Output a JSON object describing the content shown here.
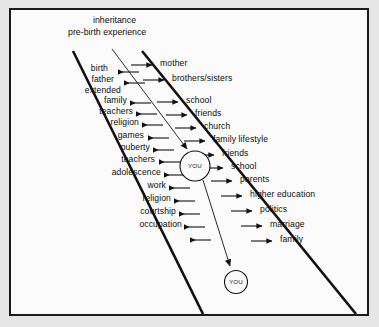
{
  "diagram": {
    "title_lines": [
      {
        "text": "inheritance",
        "x": 82,
        "y": 6
      },
      {
        "text": "pre-birth experience",
        "x": 58,
        "y": 18
      }
    ],
    "center_nodes": [
      {
        "label": "YOU",
        "cx": 184,
        "cy": 156,
        "r": 15
      },
      {
        "label": "YOU",
        "cx": 225,
        "cy": 272,
        "r": 11.5
      }
    ],
    "left_branch": {
      "name": "left-influences",
      "arrow_direction": "left",
      "labels": [
        "birth",
        "father",
        "extended",
        "family",
        "teachers",
        "religion",
        "games",
        "puberty",
        "teachers",
        "adolescence",
        "work",
        "religion",
        "courtship",
        "occupation"
      ]
    },
    "right_branch": {
      "name": "right-influences",
      "arrow_direction": "right",
      "labels": [
        "mother",
        "brothers/sisters",
        "school",
        "friends",
        "church",
        "family lifestyle",
        "friends",
        "school",
        "parents",
        "higher education",
        "politics",
        "marriage",
        "family"
      ]
    },
    "colors": {
      "ink": "#111111",
      "paper": "#fbfbfb",
      "page": "#e6e6e6",
      "frame": "#1a1a1a"
    }
  }
}
